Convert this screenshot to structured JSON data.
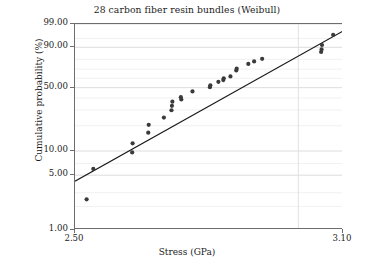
{
  "chart_data": {
    "type": "scatter",
    "title": "28 carbon fiber resin bundles (Weibull)",
    "xlabel": "Stress (GPa)",
    "ylabel": "Cumulative probability (%)",
    "xlim": [
      2.5,
      3.1
    ],
    "ylim_percent": [
      1.0,
      99.0
    ],
    "yscale": "weibull-probability",
    "grid": true,
    "legend": null,
    "xticks": [
      "2.50",
      "3.10"
    ],
    "xtick_values": [
      2.5,
      3.1
    ],
    "yticks": [
      "99.00",
      "90.00",
      "50.00",
      "10.00",
      "5.00",
      "1.00"
    ],
    "ytick_values": [
      99.0,
      90.0,
      50.0,
      10.0,
      5.0,
      1.0
    ],
    "minor_ytick_values": [
      95,
      80,
      70,
      60,
      40,
      30,
      20,
      7,
      3,
      2
    ],
    "x_gridline_values": [
      3.0
    ],
    "point_color": "#3a3a3a",
    "line_color": "#1a1a1a",
    "grid_color": "#d9d9d9",
    "axis_color": "#6d6d6d",
    "n_points": 28,
    "series": [
      {
        "name": "Stress data (median ranks)",
        "marker": "circle",
        "points": [
          {
            "x": 2.526,
            "y": 2.47
          },
          {
            "x": 2.541,
            "y": 6.0
          },
          {
            "x": 2.629,
            "y": 12.4
          },
          {
            "x": 2.628,
            "y": 9.6
          },
          {
            "x": 2.665,
            "y": 20.5
          },
          {
            "x": 2.664,
            "y": 16.6
          },
          {
            "x": 2.699,
            "y": 24.8
          },
          {
            "x": 2.716,
            "y": 29.8
          },
          {
            "x": 2.717,
            "y": 33.2
          },
          {
            "x": 2.718,
            "y": 36.7
          },
          {
            "x": 2.737,
            "y": 40.7
          },
          {
            "x": 2.738,
            "y": 38.6
          },
          {
            "x": 2.763,
            "y": 46.2
          },
          {
            "x": 2.802,
            "y": 50.5
          },
          {
            "x": 2.803,
            "y": 52.4
          },
          {
            "x": 2.821,
            "y": 56.2
          },
          {
            "x": 2.832,
            "y": 58.0
          },
          {
            "x": 2.833,
            "y": 60.0
          },
          {
            "x": 2.848,
            "y": 62.0
          },
          {
            "x": 2.861,
            "y": 68.5
          },
          {
            "x": 2.862,
            "y": 70.5
          },
          {
            "x": 2.888,
            "y": 75.5
          },
          {
            "x": 2.901,
            "y": 78.0
          },
          {
            "x": 2.919,
            "y": 80.5
          },
          {
            "x": 3.051,
            "y": 86.5
          },
          {
            "x": 3.052,
            "y": 88.5
          },
          {
            "x": 3.053,
            "y": 91.5
          },
          {
            "x": 3.078,
            "y": 96.4
          }
        ]
      }
    ],
    "fit_line": {
      "name": "Weibull fit line",
      "start": {
        "x": 2.5,
        "y": 4.2
      },
      "end": {
        "x": 3.1,
        "y": 97.6
      }
    }
  }
}
